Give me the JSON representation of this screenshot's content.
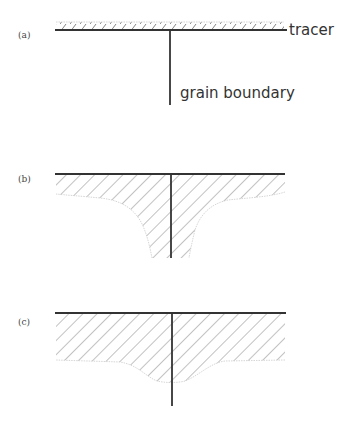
{
  "figure": {
    "panels": [
      {
        "id": "a",
        "label": "(a)",
        "annotations": {
          "surface_layer": "tracer",
          "vertical_line": "grain boundary"
        },
        "description": "thin tracer layer on the surface, grain boundary below"
      },
      {
        "id": "b",
        "label": "(b)",
        "description": "tracer diffused into bulk with deep penetration along grain boundary"
      },
      {
        "id": "c",
        "label": "(c)",
        "description": "deep bulk diffusion with shallow dip at grain boundary"
      }
    ]
  },
  "colors": {
    "line": "#333333",
    "hatch": "#666666",
    "background": "#ffffff"
  }
}
